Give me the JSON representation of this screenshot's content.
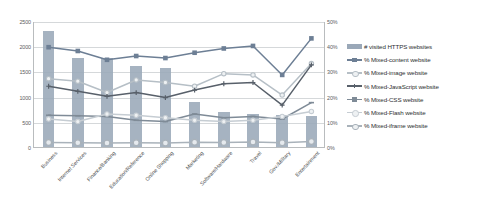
{
  "chart_data": {
    "type": "bar",
    "title": "",
    "subtitle": "",
    "xlabel": "",
    "ylabel": "",
    "y2label": "",
    "grid": true,
    "legend_position": "right",
    "ylim": [
      0,
      2500
    ],
    "y2lim": [
      0,
      50
    ],
    "yticks": [
      "0",
      "500",
      "1000",
      "1500",
      "2000",
      "2500"
    ],
    "ytick_values": [
      0,
      500,
      1000,
      1500,
      2000,
      2500
    ],
    "y2ticks": [
      "0%",
      "10%",
      "20%",
      "30%",
      "40%",
      "50%"
    ],
    "y2tick_values": [
      0,
      10,
      20,
      30,
      40,
      50
    ],
    "categories": [
      "Business",
      "Internet Services",
      "Finance/Banking",
      "Education/Reference",
      "Online Shopping",
      "Marketing",
      "Software/Hardware",
      "Travel",
      "Gov./Military",
      "Entertainment"
    ],
    "series": [
      {
        "name": "# visited HTTPS websites",
        "kind": "bar",
        "axis": "left",
        "color": "#9aa8b8",
        "marker": "none",
        "values": [
          2300,
          1760,
          1760,
          1610,
          1570,
          900,
          700,
          660,
          640,
          620
        ]
      },
      {
        "name": "% Mixed-content website",
        "kind": "line",
        "axis": "right",
        "color": "#6d7f95",
        "marker": "square",
        "values": [
          40.0,
          38.5,
          35.0,
          36.5,
          35.7,
          37.8,
          39.5,
          40.5,
          29.0,
          43.5
        ]
      },
      {
        "name": "% Mixed-image website",
        "kind": "line",
        "axis": "right",
        "color": "#b6bfc6",
        "marker": "circle",
        "values": [
          27.5,
          26.5,
          22.0,
          27.0,
          26.0,
          24.5,
          29.5,
          29.0,
          21.0,
          33.5
        ]
      },
      {
        "name": "% Mixed-JavaScript website",
        "kind": "line",
        "axis": "right",
        "color": "#58606a",
        "marker": "cross",
        "values": [
          24.5,
          22.5,
          20.5,
          22.0,
          20.0,
          23.0,
          25.5,
          26.0,
          17.0,
          33.0
        ]
      },
      {
        "name": "% Mixed-CSS website",
        "kind": "line",
        "axis": "right",
        "color": "#7f8b97",
        "marker": "dash",
        "values": [
          13.0,
          12.8,
          12.5,
          11.0,
          10.5,
          13.5,
          12.0,
          12.5,
          11.5,
          18.0
        ]
      },
      {
        "name": "% Mixed-Flash website",
        "kind": "line",
        "axis": "right",
        "color": "#c6cdd3",
        "marker": "circle",
        "values": [
          11.5,
          10.5,
          13.5,
          13.0,
          12.0,
          11.0,
          10.5,
          11.0,
          12.5,
          14.5
        ]
      },
      {
        "name": "% Mixed-iframe website",
        "kind": "line",
        "axis": "right",
        "color": "#a9b2ba",
        "marker": "circle-lg",
        "values": [
          2.2,
          2.1,
          2.0,
          2.1,
          2.0,
          2.3,
          2.2,
          2.4,
          2.1,
          2.6
        ]
      }
    ]
  },
  "legend": {
    "items": [
      {
        "label": "# visited HTTPS websites"
      },
      {
        "label": "% Mixed-content website"
      },
      {
        "label": "% Mixed-image website"
      },
      {
        "label": "% Mixed-JavaScript website"
      },
      {
        "label": "% Mixed-CSS website"
      },
      {
        "label": "% Mixed-Flash website"
      },
      {
        "label": "% Mixed-iframe website"
      }
    ]
  }
}
